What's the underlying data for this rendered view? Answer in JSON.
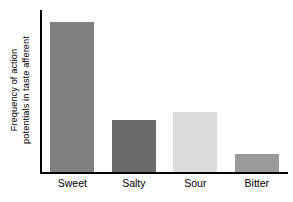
{
  "chart_data": {
    "type": "bar",
    "title": "",
    "subtitle": "",
    "xlabel": "",
    "ylabel": "Frequency of action potentials in taste afferent",
    "ylabel_lines": [
      "Frequency of action",
      "potentials in taste afferent"
    ],
    "categories": [
      "Sweet",
      "Salty",
      "Sour",
      "Bitter"
    ],
    "values": [
      100,
      35,
      40,
      12
    ],
    "ylim": [
      0,
      108
    ],
    "y_ticks": [],
    "y_tick_labels": [],
    "grid": false,
    "legend": false,
    "legend_position": "none",
    "bar_colors": [
      "#808080",
      "#6a6a6a",
      "#dcdcdc",
      "#9a9a9a"
    ],
    "axis_color": "#000000",
    "background_color": "#ffffff"
  }
}
